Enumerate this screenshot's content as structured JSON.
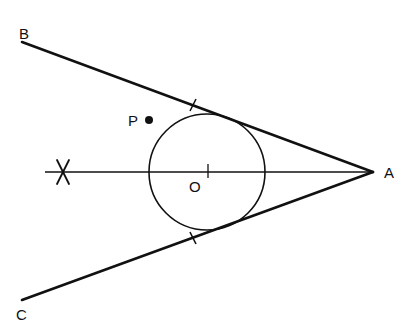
{
  "diagram": {
    "type": "geometry-construction",
    "colors": {
      "stroke": "#111111",
      "background": "#ffffff"
    },
    "points": {
      "A": {
        "label": "A",
        "x": 373,
        "y": 172
      },
      "B": {
        "label": "B",
        "x": 22,
        "y": 42
      },
      "C": {
        "label": "C",
        "x": 22,
        "y": 300
      },
      "O": {
        "label": "O",
        "x": 207,
        "y": 172
      },
      "P": {
        "label": "P",
        "x": 149,
        "y": 120
      }
    },
    "circle": {
      "center": "O",
      "radius": 58
    },
    "lines": [
      {
        "from": "A",
        "to": "B",
        "name": "tangent-AB"
      },
      {
        "from": "A",
        "to": "C",
        "name": "tangent-AC"
      },
      {
        "from": "A",
        "to": "bisector-end",
        "name": "angle-bisector"
      }
    ],
    "marks": [
      {
        "type": "cross",
        "name": "construction-arc-intersection",
        "x": 63,
        "y": 172
      },
      {
        "type": "tick",
        "on": "tangent-AB",
        "x": 193,
        "y": 105
      },
      {
        "type": "tick",
        "on": "tangent-AC",
        "x": 193,
        "y": 238
      },
      {
        "type": "tick",
        "on": "angle-bisector",
        "at": "O"
      }
    ]
  }
}
